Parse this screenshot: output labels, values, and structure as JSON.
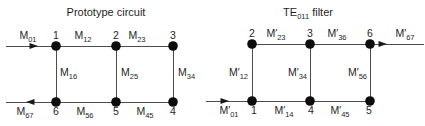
{
  "figure": {
    "width": 425,
    "height": 126,
    "colors": {
      "background": "#ffffff",
      "line": "#4c4c4c",
      "node": "#0d0d0d",
      "text": "#1f1f1f"
    },
    "diagrams": [
      {
        "name": "prototype-circuit",
        "title": {
          "base": "Prototype circuit",
          "sub": "",
          "rest": "",
          "x": 106,
          "y": 16
        },
        "node_radius": 4.8,
        "nodes": [
          {
            "id": "1",
            "x": 56,
            "y": 46,
            "label_x": 56,
            "label_y": 39
          },
          {
            "id": "2",
            "x": 116,
            "y": 46,
            "label_x": 116,
            "label_y": 39
          },
          {
            "id": "3",
            "x": 173,
            "y": 46,
            "label_x": 173,
            "label_y": 39
          },
          {
            "id": "6",
            "x": 56,
            "y": 102,
            "label_x": 56,
            "label_y": 115
          },
          {
            "id": "5",
            "x": 116,
            "y": 102,
            "label_x": 116,
            "label_y": 115
          },
          {
            "id": "4",
            "x": 173,
            "y": 102,
            "label_x": 173,
            "label_y": 115
          }
        ],
        "edges": [
          {
            "from": "1",
            "to": "2",
            "label": {
              "base": "M",
              "prime": false,
              "sub": "12"
            },
            "label_x": 83,
            "label_y": 39,
            "anchor": "middle"
          },
          {
            "from": "2",
            "to": "3",
            "label": {
              "base": "M",
              "prime": false,
              "sub": "23"
            },
            "label_x": 137,
            "label_y": 39,
            "anchor": "middle"
          },
          {
            "from": "1",
            "to": "6",
            "label": {
              "base": "M",
              "prime": false,
              "sub": "16"
            },
            "label_x": 60,
            "label_y": 76,
            "anchor": "start"
          },
          {
            "from": "2",
            "to": "5",
            "label": {
              "base": "M",
              "prime": false,
              "sub": "25"
            },
            "label_x": 121,
            "label_y": 76,
            "anchor": "start"
          },
          {
            "from": "3",
            "to": "4",
            "label": {
              "base": "M",
              "prime": false,
              "sub": "34"
            },
            "label_x": 178,
            "label_y": 76,
            "anchor": "start"
          },
          {
            "from": "6",
            "to": "5",
            "label": {
              "base": "M",
              "prime": false,
              "sub": "56"
            },
            "label_x": 85,
            "label_y": 115,
            "anchor": "middle"
          },
          {
            "from": "5",
            "to": "4",
            "label": {
              "base": "M",
              "prime": false,
              "sub": "45"
            },
            "label_x": 145,
            "label_y": 115,
            "anchor": "middle"
          }
        ],
        "ports": [
          {
            "name": "input-arrow",
            "x1": 6,
            "y1": 46,
            "x2": 56,
            "y2": 46,
            "tip_x": 38,
            "tip_y": 46,
            "dir": "right",
            "label": {
              "base": "M",
              "prime": false,
              "sub": "01"
            },
            "label_x": 28,
            "label_y": 39,
            "anchor": "middle"
          },
          {
            "name": "output-arrow",
            "x1": 6,
            "y1": 102,
            "x2": 56,
            "y2": 102,
            "tip_x": 26,
            "tip_y": 102,
            "dir": "left",
            "label": {
              "base": "M",
              "prime": false,
              "sub": "67"
            },
            "label_x": 25,
            "label_y": 115,
            "anchor": "middle"
          }
        ]
      },
      {
        "name": "te011-filter",
        "title": {
          "base": "TE",
          "sub": "011",
          "rest": " filter",
          "x": 308,
          "y": 16
        },
        "node_radius": 4.8,
        "nodes": [
          {
            "id": "2",
            "x": 252,
            "y": 44,
            "label_x": 252,
            "label_y": 37
          },
          {
            "id": "3",
            "x": 310,
            "y": 44,
            "label_x": 310,
            "label_y": 37
          },
          {
            "id": "6",
            "x": 370,
            "y": 44,
            "label_x": 370,
            "label_y": 37
          },
          {
            "id": "1",
            "x": 252,
            "y": 101,
            "label_x": 254,
            "label_y": 114
          },
          {
            "id": "4",
            "x": 310,
            "y": 101,
            "label_x": 311,
            "label_y": 114
          },
          {
            "id": "5",
            "x": 370,
            "y": 101,
            "label_x": 369,
            "label_y": 114
          }
        ],
        "edges": [
          {
            "from": "2",
            "to": "3",
            "label": {
              "base": "M",
              "prime": true,
              "sub": "23"
            },
            "label_x": 276,
            "label_y": 37,
            "anchor": "middle"
          },
          {
            "from": "3",
            "to": "6",
            "label": {
              "base": "M",
              "prime": true,
              "sub": "36"
            },
            "label_x": 337,
            "label_y": 37,
            "anchor": "middle"
          },
          {
            "from": "2",
            "to": "1",
            "label": {
              "base": "M",
              "prime": true,
              "sub": "12"
            },
            "label_x": 248,
            "label_y": 76,
            "anchor": "end"
          },
          {
            "from": "3",
            "to": "4",
            "label": {
              "base": "M",
              "prime": true,
              "sub": "34"
            },
            "label_x": 307,
            "label_y": 76,
            "anchor": "end"
          },
          {
            "from": "6",
            "to": "5",
            "label": {
              "base": "M",
              "prime": true,
              "sub": "56"
            },
            "label_x": 367,
            "label_y": 76,
            "anchor": "end"
          },
          {
            "from": "1",
            "to": "4",
            "label": {
              "base": "M",
              "prime": true,
              "sub": "14"
            },
            "label_x": 284,
            "label_y": 114,
            "anchor": "middle"
          },
          {
            "from": "4",
            "to": "5",
            "label": {
              "base": "M",
              "prime": true,
              "sub": "45"
            },
            "label_x": 340,
            "label_y": 114,
            "anchor": "middle"
          }
        ],
        "ports": [
          {
            "name": "input-arrow",
            "x1": 206,
            "y1": 101,
            "x2": 252,
            "y2": 101,
            "tip_x": 229,
            "tip_y": 101,
            "dir": "right",
            "label": {
              "base": "M",
              "prime": true,
              "sub": "01"
            },
            "label_x": 229,
            "label_y": 114,
            "anchor": "middle"
          },
          {
            "name": "output-arrow",
            "x1": 370,
            "y1": 44,
            "x2": 424,
            "y2": 44,
            "tip_x": 387,
            "tip_y": 44,
            "dir": "right",
            "label": {
              "base": "M",
              "prime": true,
              "sub": "67"
            },
            "label_x": 405,
            "label_y": 37,
            "anchor": "middle"
          }
        ]
      }
    ]
  }
}
